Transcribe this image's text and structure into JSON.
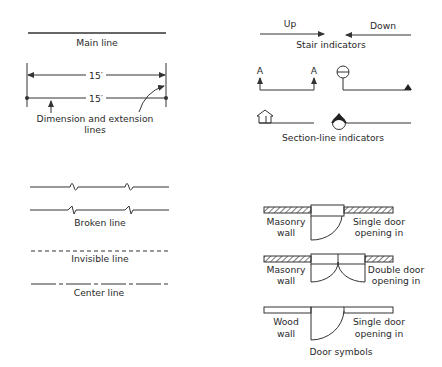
{
  "main_line": {
    "label": "Main line"
  },
  "dimension": {
    "value_top": "15′",
    "value_bottom": "15′",
    "label_line1": "Dimension and extension",
    "label_line2": "lines"
  },
  "stairs": {
    "up_label": "Up",
    "down_label": "Down",
    "caption": "Stair indicators"
  },
  "section": {
    "marker_left": "A",
    "marker_right": "A",
    "caption": "Section-line indicators"
  },
  "lines": {
    "broken_caption": "Broken line",
    "invisible_caption": "Invisible line",
    "center_caption": "Center line"
  },
  "doors": {
    "caption": "Door symbols",
    "rows": [
      {
        "wall_line1": "Masonry",
        "wall_line2": "wall",
        "door_line1": "Single door",
        "door_line2": "opening in"
      },
      {
        "wall_line1": "Masonry",
        "wall_line2": "wall",
        "door_line1": "Double door",
        "door_line2": "opening in"
      },
      {
        "wall_line1": "Wood",
        "wall_line2": "wall",
        "door_line1": "Single door",
        "door_line2": "opening in"
      }
    ]
  },
  "colors": {
    "ink": "#333333",
    "background": "#ffffff"
  }
}
